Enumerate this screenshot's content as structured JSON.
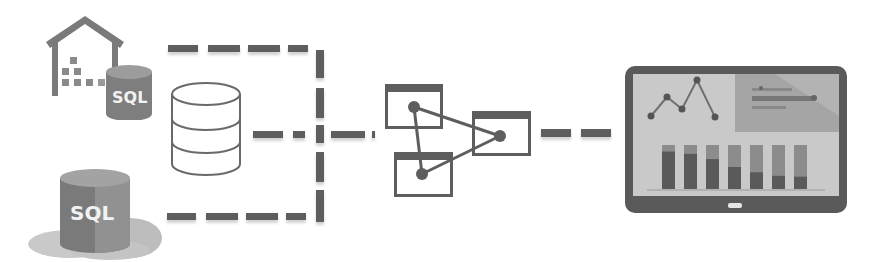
{
  "diagram": {
    "title": "",
    "colors": {
      "connector": "#5e5e5e",
      "icon_dark": "#6e6e6e",
      "icon_mid": "#8a8a8a",
      "icon_light": "#b5b5b5",
      "tablet_frame": "#5a5a5a",
      "tablet_screen": "#c9c9c9"
    },
    "sources": [
      {
        "id": "on-prem-sql",
        "icon": "warehouse-with-sql-database-icon",
        "label": "SQL"
      },
      {
        "id": "cloud-sql",
        "icon": "cloud-sql-database-icon",
        "label": "SQL"
      }
    ],
    "hub": {
      "id": "central-database",
      "icon": "database-cylinder-icon"
    },
    "processing": {
      "id": "linked-windows",
      "icon": "connected-nodes-windows-icon",
      "node_count": 3
    },
    "destination": {
      "id": "dashboard-tablet",
      "icon": "tablet-dashboard-icon",
      "panels": {
        "line_chart": {
          "type": "line",
          "points": [
            [
              0,
              0.35
            ],
            [
              1,
              0.85
            ],
            [
              2,
              0.55
            ],
            [
              3,
              1.0
            ],
            [
              4,
              0.25
            ]
          ]
        },
        "hbar_chart": {
          "type": "hbar",
          "bars": [
            0.55,
            0.85,
            0.45
          ]
        },
        "bar_chart": {
          "type": "stacked-bar",
          "bars": [
            0.85,
            0.8,
            0.68,
            0.5,
            0.38,
            0.3,
            0.28
          ]
        }
      }
    },
    "connectors": [
      {
        "from": "on-prem-sql",
        "to": "merge-bus",
        "style": "dashed"
      },
      {
        "from": "cloud-sql",
        "to": "merge-bus",
        "style": "dashed"
      },
      {
        "from": "central-database",
        "to": "linked-windows",
        "style": "dashed"
      },
      {
        "from": "linked-windows",
        "to": "dashboard-tablet",
        "style": "dashed"
      }
    ]
  }
}
